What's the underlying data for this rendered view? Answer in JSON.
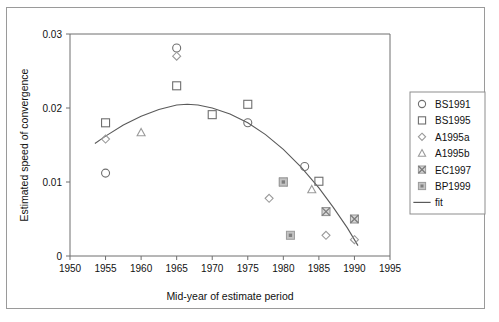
{
  "chart_data": {
    "type": "scatter",
    "title": "",
    "xlabel": "Mid-year of estimate period",
    "ylabel": "Estimated speed of convergence",
    "xlim": [
      1950,
      1995
    ],
    "ylim": [
      0,
      0.03
    ],
    "xticks": [
      1950,
      1955,
      1960,
      1965,
      1970,
      1975,
      1980,
      1985,
      1990,
      1995
    ],
    "xtick_labels": [
      "1950",
      "1955",
      "1960",
      "1965",
      "1970",
      "1975",
      "1980",
      "1985",
      "1990",
      "1995"
    ],
    "yticks": [
      0,
      0.01,
      0.02,
      0.03
    ],
    "ytick_labels": [
      "0",
      "0.01",
      "0.02",
      "0.03"
    ],
    "grid": false,
    "legend_position": "right",
    "series": [
      {
        "name": "BS1991",
        "marker": "open-circle",
        "color": "#6f6f6f",
        "points": [
          {
            "x": 1955,
            "y": 0.0112
          },
          {
            "x": 1965,
            "y": 0.0281
          },
          {
            "x": 1975,
            "y": 0.018
          },
          {
            "x": 1983,
            "y": 0.0121
          }
        ]
      },
      {
        "name": "BS1995",
        "marker": "open-square",
        "color": "#6f6f6f",
        "points": [
          {
            "x": 1955,
            "y": 0.018
          },
          {
            "x": 1965,
            "y": 0.023
          },
          {
            "x": 1970,
            "y": 0.0191
          },
          {
            "x": 1975,
            "y": 0.0205
          },
          {
            "x": 1985,
            "y": 0.0101
          }
        ]
      },
      {
        "name": "A1995a",
        "marker": "open-diamond",
        "color": "#9a9a9a",
        "points": [
          {
            "x": 1955,
            "y": 0.0158
          },
          {
            "x": 1965,
            "y": 0.027
          },
          {
            "x": 1978,
            "y": 0.0078
          },
          {
            "x": 1986,
            "y": 0.0028
          },
          {
            "x": 1990,
            "y": 0.0022
          }
        ]
      },
      {
        "name": "A1995b",
        "marker": "open-triangle",
        "color": "#9a9a9a",
        "points": [
          {
            "x": 1960,
            "y": 0.0167
          },
          {
            "x": 1984,
            "y": 0.009
          }
        ]
      },
      {
        "name": "EC1997",
        "marker": "crossed-square",
        "color": "#8f8f8f",
        "points": [
          {
            "x": 1980,
            "y": 0.01
          },
          {
            "x": 1986,
            "y": 0.006
          },
          {
            "x": 1990,
            "y": 0.005
          }
        ]
      },
      {
        "name": "BP1999",
        "marker": "filled-square",
        "color": "#9c9c9c",
        "points": [
          {
            "x": 1980,
            "y": 0.01
          },
          {
            "x": 1981,
            "y": 0.0028
          }
        ]
      }
    ],
    "fit": {
      "name": "fit",
      "style": "solid-line",
      "color": "#5a5a5a",
      "description": "quadratic fit peaking near 1966",
      "points": [
        {
          "x": 1953.5,
          "y": 0.0152
        },
        {
          "x": 1955,
          "y": 0.0162
        },
        {
          "x": 1957.5,
          "y": 0.0177
        },
        {
          "x": 1960,
          "y": 0.0189
        },
        {
          "x": 1962.5,
          "y": 0.0198
        },
        {
          "x": 1965,
          "y": 0.0204
        },
        {
          "x": 1966.5,
          "y": 0.0205
        },
        {
          "x": 1968,
          "y": 0.0204
        },
        {
          "x": 1970,
          "y": 0.02
        },
        {
          "x": 1972.5,
          "y": 0.0192
        },
        {
          "x": 1975,
          "y": 0.018
        },
        {
          "x": 1977.5,
          "y": 0.0164
        },
        {
          "x": 1980,
          "y": 0.0144
        },
        {
          "x": 1982.5,
          "y": 0.012
        },
        {
          "x": 1985,
          "y": 0.0092
        },
        {
          "x": 1987,
          "y": 0.0066
        },
        {
          "x": 1989,
          "y": 0.0038
        },
        {
          "x": 1990.5,
          "y": 0.0014
        }
      ]
    },
    "legend_entries": [
      {
        "label": "BS1991",
        "marker": "open-circle"
      },
      {
        "label": "BS1995",
        "marker": "open-square"
      },
      {
        "label": "A1995a",
        "marker": "open-diamond"
      },
      {
        "label": "A1995b",
        "marker": "open-triangle"
      },
      {
        "label": "EC1997",
        "marker": "crossed-square"
      },
      {
        "label": "BP1999",
        "marker": "filled-square"
      },
      {
        "label": "fit",
        "marker": "line"
      }
    ]
  }
}
